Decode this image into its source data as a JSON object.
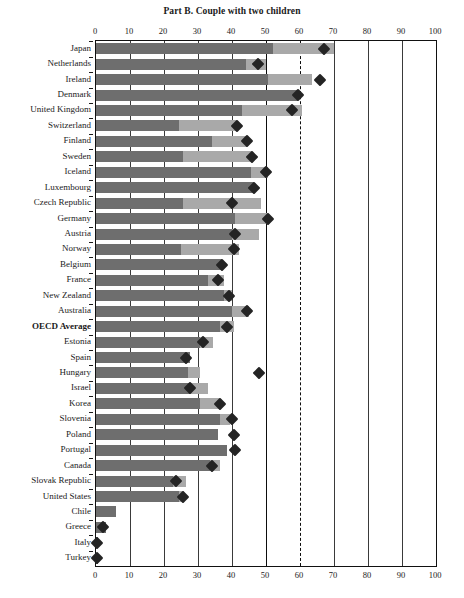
{
  "chart": {
    "title": "Part B. Couple with two children",
    "type": "bar"
  },
  "axis": {
    "ticks": [
      "0",
      "10",
      "20",
      "30",
      "40",
      "50",
      "60",
      "70",
      "80",
      "90",
      "100"
    ],
    "min": 0,
    "max": 100
  },
  "reference_lines": {
    "solid_at": 50,
    "dashed_at": 60
  },
  "colors": {
    "dark_segment": "#6e6e6e",
    "light_segment": "#a9a9a9",
    "marker": "#242424",
    "axis": "#111111",
    "background": "#ffffff"
  },
  "chart_data": {
    "type": "bar",
    "title": "Part B. Couple with two children",
    "xlabel": "",
    "ylabel": "",
    "xlim": [
      0,
      100
    ],
    "grid": true,
    "legend": "none",
    "orientation": "horizontal",
    "stacked": true,
    "series": [
      {
        "name": "dark-segment",
        "color": "#6e6e6e"
      },
      {
        "name": "light-segment",
        "color": "#a9a9a9"
      },
      {
        "name": "marker",
        "color": "#242424",
        "marker": "diamond"
      }
    ],
    "categories": [
      "Japan",
      "Netherlands",
      "Ireland",
      "Denmark",
      "United Kingdom",
      "Switzerland",
      "Finland",
      "Sweden",
      "Iceland",
      "Luxembourg",
      "Czech Republic",
      "Germany",
      "Austria",
      "Norway",
      "Belgium",
      "France",
      "New Zealand",
      "Australia",
      "OECD Average",
      "Estonia",
      "Spain",
      "Hungary",
      "Israel",
      "Korea",
      "Slovenia",
      "Poland",
      "Portugal",
      "Canada",
      "Slovak Republic",
      "United States",
      "Chile",
      "Greece",
      "Italy",
      "Turkey"
    ],
    "rows": [
      {
        "label": "Japan",
        "dark": 52.0,
        "total": 70.0,
        "marker": 67.0,
        "bold": false
      },
      {
        "label": "Netherlands",
        "dark": 44.0,
        "total": 50.0,
        "marker": 47.5,
        "bold": false
      },
      {
        "label": "Ireland",
        "dark": 50.5,
        "total": 63.5,
        "marker": 66.0,
        "bold": false
      },
      {
        "label": "Denmark",
        "dark": 59.5,
        "total": 59.5,
        "marker": 59.5,
        "bold": false
      },
      {
        "label": "United Kingdom",
        "dark": 43.0,
        "total": 60.5,
        "marker": 57.5,
        "bold": false
      },
      {
        "label": "Switzerland",
        "dark": 24.5,
        "total": 41.5,
        "marker": 41.5,
        "bold": false
      },
      {
        "label": "Finland",
        "dark": 34.0,
        "total": 44.5,
        "marker": 44.5,
        "bold": false
      },
      {
        "label": "Sweden",
        "dark": 25.5,
        "total": 46.0,
        "marker": 46.0,
        "bold": false
      },
      {
        "label": "Iceland",
        "dark": 45.5,
        "total": 50.5,
        "marker": 50.0,
        "bold": false
      },
      {
        "label": "Luxembourg",
        "dark": 46.5,
        "total": 46.5,
        "marker": 46.5,
        "bold": false
      },
      {
        "label": "Czech Republic",
        "dark": 25.5,
        "total": 48.5,
        "marker": 40.0,
        "bold": false
      },
      {
        "label": "Germany",
        "dark": 41.0,
        "total": 50.5,
        "marker": 50.5,
        "bold": false
      },
      {
        "label": "Austria",
        "dark": 40.0,
        "total": 48.0,
        "marker": 41.0,
        "bold": false
      },
      {
        "label": "Norway",
        "dark": 25.0,
        "total": 42.0,
        "marker": 40.5,
        "bold": false
      },
      {
        "label": "Belgium",
        "dark": 37.0,
        "total": 37.0,
        "marker": 37.0,
        "bold": false
      },
      {
        "label": "France",
        "dark": 33.0,
        "total": 37.5,
        "marker": 36.0,
        "bold": false
      },
      {
        "label": "New Zealand",
        "dark": 37.5,
        "total": 40.0,
        "marker": 39.0,
        "bold": false
      },
      {
        "label": "Australia",
        "dark": 40.0,
        "total": 45.0,
        "marker": 44.5,
        "bold": false
      },
      {
        "label": "OECD Average",
        "dark": 36.5,
        "total": 40.5,
        "marker": 38.5,
        "bold": true
      },
      {
        "label": "Estonia",
        "dark": 30.5,
        "total": 34.5,
        "marker": 31.5,
        "bold": false
      },
      {
        "label": "Spain",
        "dark": 27.5,
        "total": 27.5,
        "marker": 26.5,
        "bold": false
      },
      {
        "label": "Hungary",
        "dark": 27.0,
        "total": 30.5,
        "marker": 48.0,
        "bold": false
      },
      {
        "label": "Israel",
        "dark": 27.5,
        "total": 33.0,
        "marker": 27.5,
        "bold": false
      },
      {
        "label": "Korea",
        "dark": 30.5,
        "total": 36.5,
        "marker": 36.5,
        "bold": false
      },
      {
        "label": "Slovenia",
        "dark": 36.5,
        "total": 39.5,
        "marker": 40.0,
        "bold": false
      },
      {
        "label": "Poland",
        "dark": 36.0,
        "total": 36.0,
        "marker": 40.5,
        "bold": false
      },
      {
        "label": "Portugal",
        "dark": 38.5,
        "total": 38.5,
        "marker": 41.0,
        "bold": false
      },
      {
        "label": "Canada",
        "dark": 33.5,
        "total": 36.5,
        "marker": 34.0,
        "bold": false
      },
      {
        "label": "Slovak Republic",
        "dark": 22.5,
        "total": 26.5,
        "marker": 23.5,
        "bold": false
      },
      {
        "label": "United States",
        "dark": 24.5,
        "total": 26.0,
        "marker": 25.5,
        "bold": false
      },
      {
        "label": "Chile",
        "dark": 6.0,
        "total": 6.0,
        "marker": null,
        "bold": false
      },
      {
        "label": "Greece",
        "dark": 3.0,
        "total": 3.0,
        "marker": 2.0,
        "bold": false
      },
      {
        "label": "Italy",
        "dark": 0.4,
        "total": 0.4,
        "marker": 0.3,
        "bold": false
      },
      {
        "label": "Turkey",
        "dark": 0.4,
        "total": 0.4,
        "marker": 0.3,
        "bold": false
      }
    ]
  }
}
